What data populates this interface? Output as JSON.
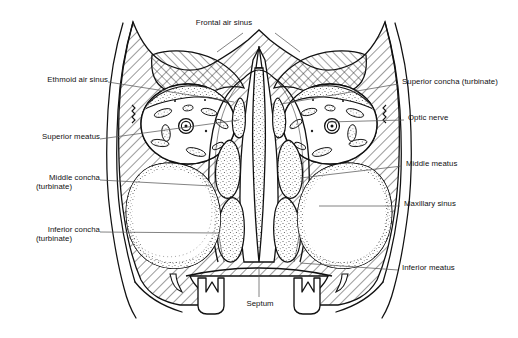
{
  "figure": {
    "title": "Figure 1  The upper respiratory tract",
    "title_visible": false,
    "background_color": "#ffffff",
    "ink_color": "#111111",
    "leader_color": "#5a5a5a",
    "view": "coronal section through the head showing the paranasal sinuses and nasal cavity"
  },
  "labels": {
    "frontal_air_sinus": "Frontal air sinus",
    "ethmoid_air_sinus": "Ethmoid air sinus",
    "superior_meatus": "Superior meatus",
    "middle_concha": "Middle concha",
    "middle_concha_sub": "(turbinate)",
    "inferior_concha": "Inferior concha",
    "inferior_concha_sub": "(turbinate)",
    "superior_concha": "Superior concha (turbinate)",
    "optic_nerve": "Optic nerve",
    "middle_meatus": "Middle meatus",
    "maxillary_sinus": "Maxillary sinus",
    "inferior_meatus": "Inferior meatus",
    "septum": "Septum"
  },
  "label_positions": {
    "frontal_air_sinus": {
      "x": 224,
      "y": 22,
      "align": "center"
    },
    "ethmoid_air_sinus": {
      "x": 18,
      "y": 79,
      "align": "left"
    },
    "superior_meatus": {
      "x": 18,
      "y": 136,
      "align": "left"
    },
    "middle_concha": {
      "x": 18,
      "y": 177,
      "align": "left"
    },
    "inferior_concha": {
      "x": 18,
      "y": 229,
      "align": "left"
    },
    "superior_concha": {
      "x": 402,
      "y": 81,
      "align": "left"
    },
    "optic_nerve": {
      "x": 408,
      "y": 117,
      "align": "left"
    },
    "middle_meatus": {
      "x": 406,
      "y": 163,
      "align": "left"
    },
    "maxillary_sinus": {
      "x": 404,
      "y": 203,
      "align": "left"
    },
    "inferior_meatus": {
      "x": 402,
      "y": 267,
      "align": "left"
    },
    "septum": {
      "x": 260,
      "y": 303,
      "align": "center"
    }
  },
  "leader_lines": [
    {
      "name": "frontal-air-sinus-left",
      "points": "243,33 217,52"
    },
    {
      "name": "frontal-air-sinus-right",
      "points": "275,33 300,52"
    },
    {
      "name": "ethmoid-air-sinus",
      "points": "108,82 234,102"
    },
    {
      "name": "superior-meatus",
      "points": "100,139 239,120"
    },
    {
      "name": "middle-concha",
      "points": "100,180 212,186"
    },
    {
      "name": "inferior-concha",
      "points": "100,232 218,233"
    },
    {
      "name": "superior-concha",
      "points": "398,84 281,104"
    },
    {
      "name": "optic-nerve",
      "points": "404,120 328,122"
    },
    {
      "name": "middle-meatus",
      "points": "402,166 300,178"
    },
    {
      "name": "maxillary-sinus",
      "points": "400,206 319,206"
    },
    {
      "name": "inferior-meatus",
      "points": "398,270 300,263"
    },
    {
      "name": "septum",
      "points": "259,297 259,268"
    }
  ]
}
